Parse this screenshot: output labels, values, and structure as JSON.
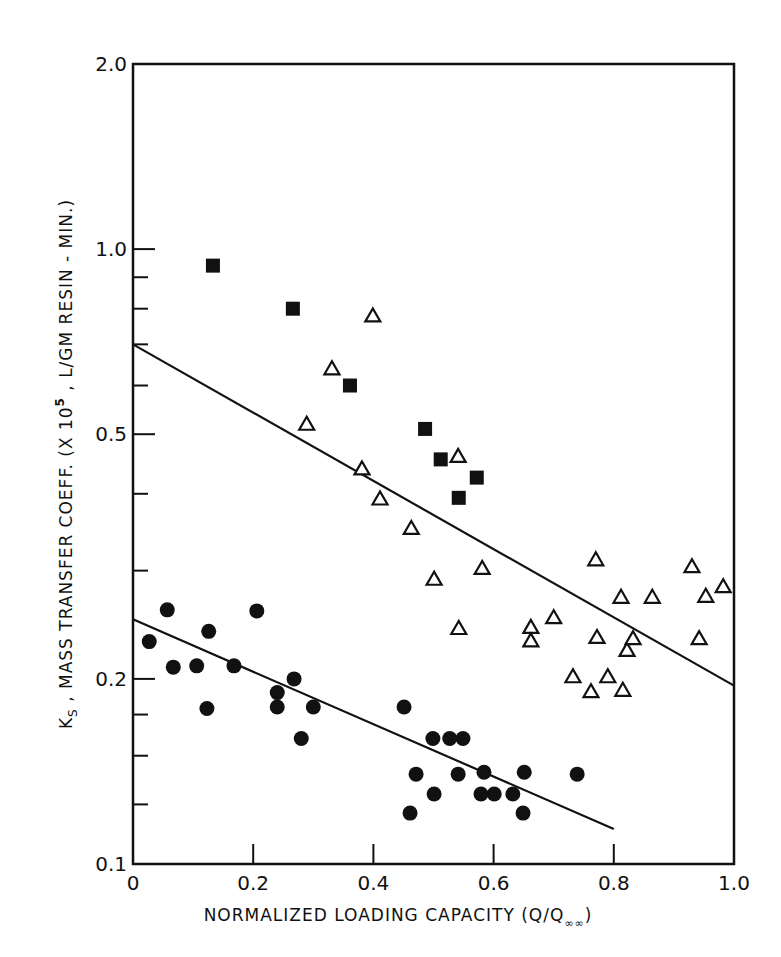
{
  "chart_data": {
    "type": "scatter",
    "title": "",
    "xlabel": "NORMALIZED LOADING CAPACITY (Q/Q∞)",
    "ylabel": "KS , MASS TRANSFER COEFF. (X 10^5 , L/GM RESIN - MIN.)",
    "xlabel_parts": {
      "main": "NORMALIZED LOADING CAPACITY (Q/Q",
      "sub": "∞∞",
      "close": ")"
    },
    "ylabel_parts": {
      "k": "K",
      "k_sub": "S",
      "rest": " , MASS TRANSFER COEFF. (X 10",
      "exp": "5",
      "tail": " , L/GM RESIN - MIN.)"
    },
    "x_scale": "linear",
    "y_scale": "log",
    "xlim": [
      0,
      1.0
    ],
    "ylim": [
      0.1,
      2.0
    ],
    "x_ticks": [
      0,
      0.2,
      0.4,
      0.6,
      0.8,
      1.0
    ],
    "x_tick_labels": [
      "0",
      "0.2",
      "0.4",
      "0.6",
      "0.8",
      "1.0"
    ],
    "y_ticks": [
      0.1,
      0.2,
      0.5,
      1.0,
      2.0
    ],
    "y_tick_labels": [
      "0.1",
      "0.2",
      "0.5",
      "1.0",
      "2.0"
    ],
    "y_minor_ticks": [
      0.125,
      0.15,
      0.175,
      0.3,
      0.4,
      0.6,
      0.7,
      0.8,
      0.9
    ],
    "grid": false,
    "legend": null,
    "series": [
      {
        "name": "filled squares",
        "marker": "square-filled",
        "points": [
          [
            0.133,
            0.94
          ],
          [
            0.266,
            0.8
          ],
          [
            0.361,
            0.6
          ],
          [
            0.486,
            0.51
          ],
          [
            0.512,
            0.455
          ],
          [
            0.542,
            0.394
          ],
          [
            0.572,
            0.425
          ]
        ]
      },
      {
        "name": "open triangles",
        "marker": "triangle-open",
        "points": [
          [
            0.289,
            0.52
          ],
          [
            0.331,
            0.64
          ],
          [
            0.381,
            0.44
          ],
          [
            0.399,
            0.78
          ],
          [
            0.411,
            0.393
          ],
          [
            0.463,
            0.352
          ],
          [
            0.501,
            0.291
          ],
          [
            0.541,
            0.461
          ],
          [
            0.542,
            0.242
          ],
          [
            0.581,
            0.303
          ],
          [
            0.662,
            0.243
          ],
          [
            0.662,
            0.231
          ],
          [
            0.7,
            0.252
          ],
          [
            0.732,
            0.202
          ],
          [
            0.762,
            0.191
          ],
          [
            0.77,
            0.313
          ],
          [
            0.772,
            0.234
          ],
          [
            0.79,
            0.202
          ],
          [
            0.812,
            0.272
          ],
          [
            0.815,
            0.192
          ],
          [
            0.822,
            0.223
          ],
          [
            0.832,
            0.233
          ],
          [
            0.864,
            0.272
          ],
          [
            0.93,
            0.305
          ],
          [
            0.942,
            0.233
          ],
          [
            0.953,
            0.273
          ],
          [
            0.982,
            0.283
          ]
        ]
      },
      {
        "name": "filled circles",
        "marker": "circle-filled",
        "points": [
          [
            0.027,
            0.23
          ],
          [
            0.057,
            0.259
          ],
          [
            0.067,
            0.209
          ],
          [
            0.106,
            0.21
          ],
          [
            0.123,
            0.179
          ],
          [
            0.126,
            0.239
          ],
          [
            0.168,
            0.21
          ],
          [
            0.206,
            0.258
          ],
          [
            0.24,
            0.19
          ],
          [
            0.24,
            0.18
          ],
          [
            0.268,
            0.2
          ],
          [
            0.28,
            0.16
          ],
          [
            0.3,
            0.18
          ],
          [
            0.451,
            0.18
          ],
          [
            0.461,
            0.121
          ],
          [
            0.471,
            0.14
          ],
          [
            0.499,
            0.16
          ],
          [
            0.501,
            0.13
          ],
          [
            0.527,
            0.16
          ],
          [
            0.541,
            0.14
          ],
          [
            0.549,
            0.16
          ],
          [
            0.579,
            0.13
          ],
          [
            0.584,
            0.141
          ],
          [
            0.601,
            0.13
          ],
          [
            0.632,
            0.13
          ],
          [
            0.649,
            0.121
          ],
          [
            0.651,
            0.141
          ],
          [
            0.739,
            0.14
          ]
        ]
      }
    ],
    "fit_lines": [
      {
        "name": "upper fit (squares + triangles)",
        "from": [
          0.0,
          0.7
        ],
        "to": [
          1.0,
          0.195
        ]
      },
      {
        "name": "lower fit (circles)",
        "from": [
          0.0,
          0.25
        ],
        "to": [
          0.8,
          0.114
        ]
      }
    ]
  },
  "caption": {
    "text": "",
    "note": "caption line partially cropped at bottom edge; text not legible"
  }
}
